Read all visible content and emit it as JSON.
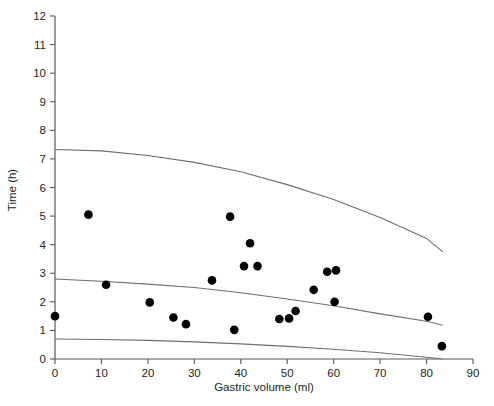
{
  "chart_data": {
    "type": "scatter",
    "title": "",
    "xlabel": "Gastric volume (ml)",
    "ylabel": "Time (h)",
    "xlim": [
      0,
      90
    ],
    "ylim": [
      0,
      12
    ],
    "xticks": [
      0,
      10,
      20,
      30,
      40,
      50,
      60,
      70,
      80,
      90
    ],
    "yticks": [
      0,
      1,
      2,
      3,
      4,
      5,
      6,
      7,
      8,
      9,
      10,
      11,
      12
    ],
    "grid": false,
    "legend": "none",
    "point_color": "#000000",
    "curve_color": "#6d6e71",
    "axis_color": "#58595b",
    "points": [
      {
        "x": 0.0,
        "y": 1.5
      },
      {
        "x": 7.2,
        "y": 5.05
      },
      {
        "x": 11.0,
        "y": 2.6
      },
      {
        "x": 20.4,
        "y": 1.98
      },
      {
        "x": 25.5,
        "y": 1.45
      },
      {
        "x": 28.2,
        "y": 1.22
      },
      {
        "x": 33.8,
        "y": 2.75
      },
      {
        "x": 37.7,
        "y": 4.98
      },
      {
        "x": 38.6,
        "y": 1.02
      },
      {
        "x": 42.0,
        "y": 4.05
      },
      {
        "x": 40.7,
        "y": 3.25
      },
      {
        "x": 43.6,
        "y": 3.25
      },
      {
        "x": 48.3,
        "y": 1.4
      },
      {
        "x": 50.4,
        "y": 1.42
      },
      {
        "x": 51.8,
        "y": 1.68
      },
      {
        "x": 55.7,
        "y": 2.42
      },
      {
        "x": 58.6,
        "y": 3.05
      },
      {
        "x": 60.5,
        "y": 3.1
      },
      {
        "x": 60.2,
        "y": 2.0
      },
      {
        "x": 80.3,
        "y": 1.48
      },
      {
        "x": 83.3,
        "y": 0.45
      }
    ],
    "curves": [
      {
        "name": "upper-prediction-band",
        "points": [
          {
            "x": 0,
            "y": 7.33
          },
          {
            "x": 10,
            "y": 7.28
          },
          {
            "x": 20,
            "y": 7.12
          },
          {
            "x": 30,
            "y": 6.88
          },
          {
            "x": 40,
            "y": 6.55
          },
          {
            "x": 50,
            "y": 6.1
          },
          {
            "x": 60,
            "y": 5.58
          },
          {
            "x": 70,
            "y": 4.95
          },
          {
            "x": 80,
            "y": 4.22
          },
          {
            "x": 83.5,
            "y": 3.75
          }
        ]
      },
      {
        "name": "mean-regression-line",
        "points": [
          {
            "x": 0,
            "y": 2.8
          },
          {
            "x": 10,
            "y": 2.72
          },
          {
            "x": 20,
            "y": 2.62
          },
          {
            "x": 30,
            "y": 2.5
          },
          {
            "x": 40,
            "y": 2.32
          },
          {
            "x": 50,
            "y": 2.1
          },
          {
            "x": 60,
            "y": 1.86
          },
          {
            "x": 70,
            "y": 1.58
          },
          {
            "x": 80,
            "y": 1.32
          },
          {
            "x": 83.5,
            "y": 1.18
          }
        ]
      },
      {
        "name": "lower-prediction-band",
        "points": [
          {
            "x": 0,
            "y": 0.7
          },
          {
            "x": 10,
            "y": 0.68
          },
          {
            "x": 20,
            "y": 0.65
          },
          {
            "x": 30,
            "y": 0.6
          },
          {
            "x": 40,
            "y": 0.53
          },
          {
            "x": 50,
            "y": 0.44
          },
          {
            "x": 60,
            "y": 0.34
          },
          {
            "x": 70,
            "y": 0.22
          },
          {
            "x": 80,
            "y": 0.06
          },
          {
            "x": 83.5,
            "y": 0.0
          }
        ]
      }
    ]
  },
  "axes": {
    "y_title": "Time (h)",
    "x_title": "Gastric volume (ml)",
    "y_tick_labels": [
      "0",
      "1",
      "2",
      "3",
      "4",
      "5",
      "6",
      "7",
      "8",
      "9",
      "10",
      "11",
      "12"
    ],
    "x_tick_labels": [
      "0",
      "10",
      "20",
      "30",
      "40",
      "50",
      "60",
      "70",
      "80",
      "90"
    ]
  }
}
